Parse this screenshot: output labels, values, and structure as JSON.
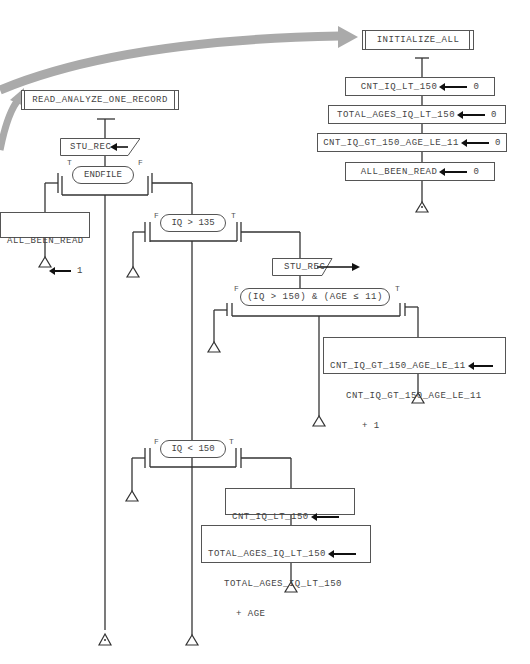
{
  "diagram": {
    "type": "structured-flowchart",
    "flow_arrow_color": "#a8a8a8",
    "line_color": "#333333",
    "initialize": {
      "title": "INITIALIZE_ALL",
      "assignments": [
        {
          "target": "CNT_IQ_LT_150",
          "value": "0"
        },
        {
          "target": "TOTAL_AGES_IQ_LT_150",
          "value": "0"
        },
        {
          "target": "CNT_IQ_GT_150_AGE_LE_11",
          "value": "0"
        },
        {
          "target": "ALL_BEEN_READ",
          "value": "0"
        }
      ]
    },
    "read_analyze": {
      "title": "READ_ANALYZE_ONE_RECORD",
      "read1": "STU_REC",
      "endfile_cond": "ENDFILE",
      "endfile_true": {
        "target": "ALL_BEEN_READ",
        "value": "1"
      },
      "iq135_cond": "IQ > 135",
      "read2": "STU_REC",
      "iq150_age_cond": "(IQ > 150) & (AGE ≤ 11)",
      "iq150_age_true": {
        "line1": "CNT_IQ_GT_150_AGE_LE_11",
        "line2": "CNT_IQ_GT_150_AGE_LE_11",
        "line3": "+ 1"
      },
      "iq_lt_150_cond": "IQ < 150",
      "iq_lt_150_true_1": {
        "line1": "CNT_IQ_LT_150",
        "line2": "CNT_IQ_LT_150 + 1"
      },
      "iq_lt_150_true_2": {
        "line1": "TOTAL_AGES_IQ_LT_150",
        "line2": "TOTAL_AGES_IQ_LT_150",
        "line3": "+ AGE"
      },
      "labels": {
        "t": "T",
        "f": "F"
      }
    }
  }
}
